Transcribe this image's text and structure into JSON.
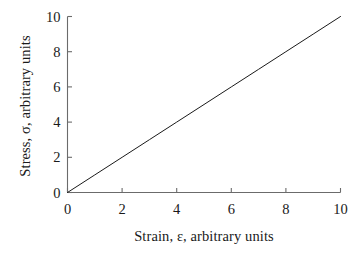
{
  "chart_data": {
    "type": "line",
    "title": "",
    "subtitle": "",
    "xlabel": "Strain, ε, arbitrary units",
    "ylabel": "Stress, σ, arbitrary units",
    "xlim": [
      0,
      10
    ],
    "ylim": [
      0,
      10
    ],
    "xticks": [
      0,
      2,
      4,
      6,
      8,
      10
    ],
    "yticks": [
      0,
      2,
      4,
      6,
      8,
      10
    ],
    "xtick_labels": [
      "0",
      "2",
      "4",
      "6",
      "8",
      "10"
    ],
    "ytick_labels": [
      "0",
      "2",
      "4",
      "6",
      "8",
      "10"
    ],
    "grid": false,
    "legend": null,
    "annotations": [],
    "series": [
      {
        "name": "linear elastic response",
        "color": "#1a1a1a",
        "line_width": 1,
        "x": [
          0,
          1,
          2,
          3,
          4,
          5,
          6,
          7,
          8,
          9,
          10
        ],
        "y": [
          0,
          1,
          2,
          3,
          4,
          5,
          6,
          7,
          8,
          9,
          10
        ]
      }
    ],
    "slope": 1.0,
    "intercept": 0.0
  },
  "style": {
    "axis_color": "#6b6b6b",
    "line_color": "#1a1a1a",
    "background": "#ffffff",
    "tick_direction": "in",
    "spines": [
      "left",
      "bottom"
    ]
  }
}
